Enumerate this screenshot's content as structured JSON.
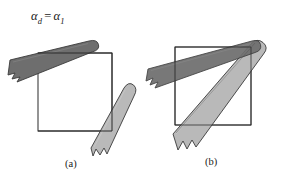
{
  "figure": {
    "width": 283,
    "height": 181,
    "background": "#ffffff",
    "equation": {
      "alpha_left": "α",
      "subscript_left": "d",
      "equals": "=",
      "alpha_right": "α",
      "subscript_right": "1",
      "full_text": "αd = α1"
    },
    "panels": [
      {
        "id": "a",
        "label": "(a)"
      },
      {
        "id": "b",
        "label": "(b)"
      }
    ],
    "colors": {
      "dark_band_fill": "#6e6e6e",
      "light_band_fill": "#b9b9b9",
      "band_stroke": "#3a3a3a",
      "square_stroke": "#2b2b2b",
      "text": "#1a1a1a",
      "background": "#ffffff"
    },
    "panel_a": {
      "square": {
        "x": 38,
        "y": 53,
        "width": 74,
        "height": 78
      },
      "bands": [
        {
          "name": "dark-band",
          "shade": "dark",
          "angle_deg": -14,
          "end_cap": "rounded-right",
          "break_end": "left"
        },
        {
          "name": "light-band",
          "shade": "light",
          "angle_deg": -48,
          "end_cap": "rounded-top-right",
          "break_end": "bottom-left"
        }
      ]
    },
    "panel_b": {
      "square": {
        "x": 175,
        "y": 47,
        "width": 76,
        "height": 78
      },
      "bands": [
        {
          "name": "dark-band",
          "shade": "dark",
          "angle_deg": -19,
          "end_cap": "rounded-right",
          "break_end": "left"
        },
        {
          "name": "light-band",
          "shade": "light",
          "angle_deg": -49,
          "end_cap": "rounded-top-right",
          "break_end": "bottom-left"
        }
      ],
      "note": "both bands converge at a shared rounded cap at upper right"
    }
  }
}
